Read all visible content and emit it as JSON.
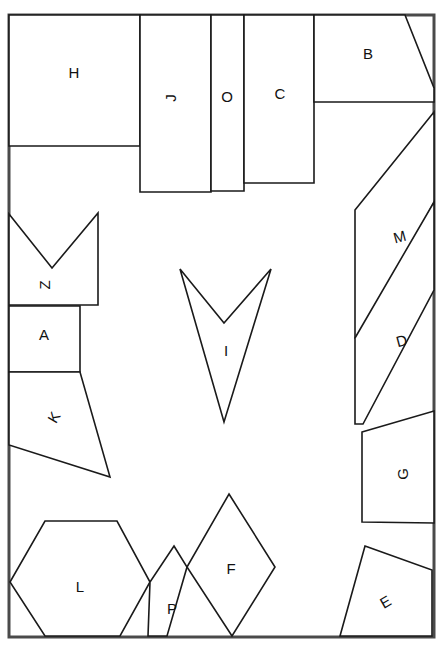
{
  "figure": {
    "width": 443,
    "height": 645,
    "background_color": "#ffffff",
    "outline_color": "#1a1a1a",
    "frame_color": "#4a4a4a",
    "label_color": "#111111",
    "frame": {
      "x": 9,
      "y": 15,
      "width": 425,
      "height": 622
    }
  },
  "regions": [
    {
      "id": "H",
      "label": "H",
      "shape": "rectangle",
      "points": "9,15 140,15 140,146 9,146",
      "label_x": 74,
      "label_y": 74,
      "label_rotation": 0
    },
    {
      "id": "J",
      "label": "J",
      "shape": "rectangle",
      "points": "140,15 211,15 211,192 140,192",
      "label_x": 172,
      "label_y": 98,
      "label_rotation": -90
    },
    {
      "id": "O",
      "label": "O",
      "shape": "rectangle",
      "points": "211,15 244,15 244,191 211,191",
      "label_x": 227,
      "label_y": 98,
      "label_rotation": 0
    },
    {
      "id": "C",
      "label": "C",
      "shape": "rectangle",
      "points": "244,15 314,15 314,183 244,183",
      "label_x": 280,
      "label_y": 95,
      "label_rotation": 0
    },
    {
      "id": "B",
      "label": "B",
      "shape": "pentagon",
      "points": "314,15 405,15 434,88 434,102 314,102",
      "label_x": 368,
      "label_y": 55,
      "label_rotation": 0
    },
    {
      "id": "Z",
      "label": "Z",
      "shape": "chevron",
      "points": "9,214 52,268 98,213 98,305 9,305",
      "label_x": 46,
      "label_y": 285,
      "label_rotation": -90
    },
    {
      "id": "A",
      "label": "A",
      "shape": "rectangle",
      "points": "9,306 80,306 80,372 9,372",
      "label_x": 44,
      "label_y": 336,
      "label_rotation": 0
    },
    {
      "id": "K",
      "label": "K",
      "shape": "quadrilateral",
      "points": "9,372 80,372 110,477 9,445",
      "label_x": 55,
      "label_y": 418,
      "label_rotation": -60
    },
    {
      "id": "I",
      "label": "I",
      "shape": "arrow",
      "points": "180,269 224,323 271,269 224,422",
      "label_x": 226,
      "label_y": 352,
      "label_rotation": 0
    },
    {
      "id": "M",
      "label": "M",
      "shape": "pentagon",
      "points": "355,210 434,112 434,202 363,338 355,338",
      "label_x": 400,
      "label_y": 238,
      "label_rotation": -15
    },
    {
      "id": "D",
      "label": "D",
      "shape": "parallelogram",
      "points": "355,338 434,202 434,290 363,424 355,424",
      "label_x": 402,
      "label_y": 342,
      "label_rotation": -15
    },
    {
      "id": "G",
      "label": "G",
      "shape": "quadrilateral",
      "points": "362,432 434,411 434,523 362,522",
      "label_x": 404,
      "label_y": 474,
      "label_rotation": -90
    },
    {
      "id": "E",
      "label": "E",
      "shape": "quadrilateral",
      "points": "365,546 432,570 432,636 340,636",
      "label_x": 386,
      "label_y": 603,
      "label_rotation": -30
    },
    {
      "id": "L",
      "label": "L",
      "shape": "hexagon",
      "points": "45,521 117,521 150,582 120,636 45,636 10,582",
      "label_x": 80,
      "label_y": 588,
      "label_rotation": 0
    },
    {
      "id": "P",
      "label": "P",
      "shape": "quadrilateral",
      "points": "174,546 187,567 167,636 148,636 150,582",
      "label_x": 172,
      "label_y": 610,
      "label_rotation": 0
    },
    {
      "id": "F",
      "label": "F",
      "shape": "diamond",
      "points": "229,494 275,567 232,636 187,567",
      "label_x": 231,
      "label_y": 570,
      "label_rotation": 0
    }
  ]
}
